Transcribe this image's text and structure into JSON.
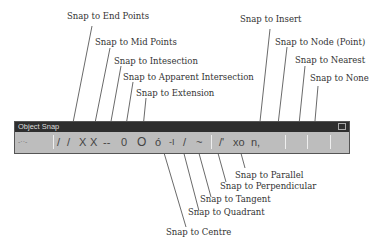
{
  "toolbar": {
    "title": "Object Snap",
    "buttons": [
      {
        "name": "end-points",
        "glyph": "/"
      },
      {
        "name": "mid-points",
        "glyph": "/"
      },
      {
        "name": "intersection",
        "glyph": "X"
      },
      {
        "name": "apparent-intersection",
        "glyph": "X"
      },
      {
        "name": "extension",
        "glyph": "--"
      },
      {
        "name": "insert",
        "glyph": "0"
      },
      {
        "name": "centre",
        "glyph": "O"
      },
      {
        "name": "quadrant",
        "glyph": "ó"
      },
      {
        "name": "tangent",
        "glyph": "-I"
      },
      {
        "name": "perpendicular",
        "glyph": "/"
      },
      {
        "name": "parallel",
        "glyph": "~"
      },
      {
        "name": "node",
        "glyph": "/'"
      },
      {
        "name": "nearest",
        "glyph": "xo"
      },
      {
        "name": "none",
        "glyph": "n,"
      }
    ]
  },
  "labels": {
    "end_points": "Snap to End Points",
    "mid_points": "Snap to Mid Points",
    "intersection": "Snap to Intesection",
    "apparent_intersection": "Snap to Apparent Intersection",
    "extension": "Snap to Extension",
    "insert": "Snap to Insert",
    "node": "Snap to Node (Point)",
    "nearest": "Snap to Nearest",
    "none": "Snap to None",
    "parallel": "Snap to Parallel",
    "perpendicular": "Snap to Perpendicular",
    "tangent": "Snap to Tangent",
    "quadrant": "Snap to Quadrant",
    "centre": "Snap to Centre"
  }
}
